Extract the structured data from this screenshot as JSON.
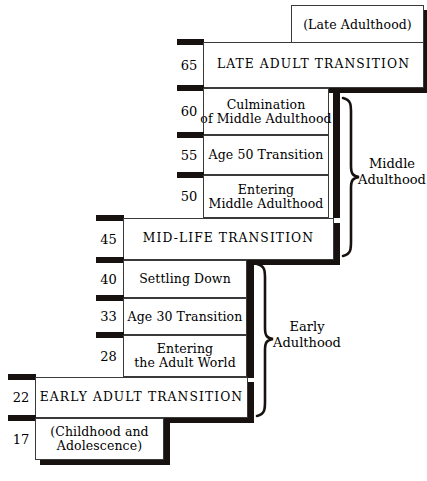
{
  "diagram": {
    "rows": [
      {
        "id": "late-adulthood",
        "age": "",
        "text": "(Late Adulthood)",
        "style": "normal"
      },
      {
        "id": "late-adult-transition",
        "age": "65",
        "text": "LATE ADULT TRANSITION",
        "style": "caps"
      },
      {
        "id": "culmination-middle-adulthood",
        "age": "60",
        "text": "Culmination\nof Middle Adulthood",
        "style": "normal"
      },
      {
        "id": "age-50-transition",
        "age": "55",
        "text": "Age 50 Transition",
        "style": "normal"
      },
      {
        "id": "entering-middle-adulthood",
        "age": "50",
        "text": "Entering\nMiddle Adulthood",
        "style": "normal"
      },
      {
        "id": "mid-life-transition",
        "age": "45",
        "text": "MID-LIFE TRANSITION",
        "style": "caps"
      },
      {
        "id": "settling-down",
        "age": "40",
        "text": "Settling Down",
        "style": "normal"
      },
      {
        "id": "age-30-transition",
        "age": "33",
        "text": "Age 30 Transition",
        "style": "normal"
      },
      {
        "id": "entering-adult-world",
        "age": "28",
        "text": "Entering\nthe Adult World",
        "style": "normal"
      },
      {
        "id": "early-adult-transition",
        "age": "22",
        "text": "EARLY ADULT TRANSITION",
        "style": "caps"
      },
      {
        "id": "childhood-adolescence",
        "age": "17",
        "text": "(Childhood and\nAdolescence)",
        "style": "normal"
      }
    ],
    "groups": [
      {
        "id": "middle-adulthood",
        "text": "Middle\nAdulthood"
      },
      {
        "id": "early-adulthood",
        "text": "Early\nAdulthood"
      }
    ],
    "colors": {
      "ink": "#17110f",
      "rule": "#3a3a3a",
      "paper": "#ffffff"
    }
  }
}
